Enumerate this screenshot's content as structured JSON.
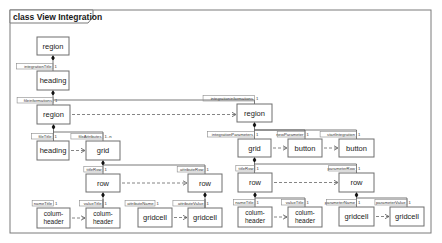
{
  "diagram": {
    "title": "class View Integration",
    "frame": {
      "x": 10,
      "y": 10,
      "w": 421,
      "h": 223
    },
    "classes": [
      {
        "id": "c1",
        "label": "region",
        "x": 37,
        "y": 37,
        "w": 32,
        "h": 18
      },
      {
        "id": "c2",
        "label": "heading",
        "x": 37,
        "y": 71,
        "w": 32,
        "h": 19
      },
      {
        "id": "c3",
        "label": "region",
        "x": 37,
        "y": 105,
        "w": 33,
        "h": 19
      },
      {
        "id": "c4",
        "label": "heading",
        "x": 37,
        "y": 141,
        "w": 32,
        "h": 19
      },
      {
        "id": "c5",
        "label": "grid",
        "x": 86,
        "y": 141,
        "w": 34,
        "h": 19
      },
      {
        "id": "c6",
        "label": "row",
        "x": 86,
        "y": 174,
        "w": 34,
        "h": 18
      },
      {
        "id": "c7",
        "label": "row",
        "x": 188,
        "y": 174,
        "w": 34,
        "h": 18
      },
      {
        "id": "c8",
        "label": "colum-|header",
        "x": 37,
        "y": 208,
        "w": 33,
        "h": 20
      },
      {
        "id": "c9",
        "label": "colum-|header",
        "x": 86,
        "y": 208,
        "w": 34,
        "h": 20
      },
      {
        "id": "c10",
        "label": "gridcell",
        "x": 138,
        "y": 208,
        "w": 34,
        "h": 19
      },
      {
        "id": "c11",
        "label": "gridcell",
        "x": 188,
        "y": 208,
        "w": 34,
        "h": 19
      },
      {
        "id": "c12",
        "label": "region",
        "x": 237,
        "y": 104,
        "w": 35,
        "h": 18
      },
      {
        "id": "c13",
        "label": "grid",
        "x": 238,
        "y": 139,
        "w": 33,
        "h": 18
      },
      {
        "id": "c14",
        "label": "button",
        "x": 288,
        "y": 139,
        "w": 34,
        "h": 18
      },
      {
        "id": "c15",
        "label": "button",
        "x": 339,
        "y": 139,
        "w": 35,
        "h": 18
      },
      {
        "id": "c16",
        "label": "row",
        "x": 238,
        "y": 173,
        "w": 34,
        "h": 19
      },
      {
        "id": "c17",
        "label": "row",
        "x": 339,
        "y": 173,
        "w": 35,
        "h": 19
      },
      {
        "id": "c18",
        "label": "colum-|header",
        "x": 238,
        "y": 207,
        "w": 34,
        "h": 20
      },
      {
        "id": "c19",
        "label": "colum-|header",
        "x": 288,
        "y": 207,
        "w": 34,
        "h": 20
      },
      {
        "id": "c20",
        "label": "gridcell",
        "x": 339,
        "y": 207,
        "w": 35,
        "h": 19
      },
      {
        "id": "c21",
        "label": "gridcell",
        "x": 390,
        "y": 207,
        "w": 34,
        "h": 19
      }
    ],
    "compositions": [
      {
        "from": "c1",
        "role": "integrationTitle",
        "mult": "1",
        "to": "c2"
      },
      {
        "from": "c2",
        "role": "fileinformations",
        "mult": "1",
        "to": "c3"
      },
      {
        "from": "c2",
        "role": "integrationinformations",
        "mult": "1",
        "to": "c12"
      },
      {
        "from": "c3",
        "role": "fileTitle",
        "mult": "1",
        "to": "c4"
      },
      {
        "from": "c3",
        "role": "fileAttributes",
        "mult": "1..n",
        "to": "c5"
      },
      {
        "from": "c5",
        "role": "titleRow",
        "mult": "1",
        "to": "c6"
      },
      {
        "from": "c5",
        "role": "attributeRow",
        "mult": "1",
        "to": "c7"
      },
      {
        "from": "c6",
        "role": "nameTitle",
        "mult": "1",
        "to": "c8"
      },
      {
        "from": "c6",
        "role": "valueTitle",
        "mult": "1",
        "to": "c9"
      },
      {
        "from": "c7",
        "role": "attributeName",
        "mult": "1",
        "to": "c10"
      },
      {
        "from": "c7",
        "role": "attributeValue",
        "mult": "1",
        "to": "c11"
      },
      {
        "from": "c12",
        "role": "integrationParameters",
        "mult": "1",
        "to": "c13"
      },
      {
        "from": "c12",
        "role": "newParameter",
        "mult": "1",
        "to": "c14"
      },
      {
        "from": "c12",
        "role": "startIntegration",
        "mult": "1",
        "to": "c15"
      },
      {
        "from": "c13",
        "role": "titleRow",
        "mult": "1",
        "to": "c16"
      },
      {
        "from": "c13",
        "role": "parameterRow",
        "mult": "1",
        "to": "c17"
      },
      {
        "from": "c16",
        "role": "nameTitle",
        "mult": "1",
        "to": "c18"
      },
      {
        "from": "c16",
        "role": "valueTitle",
        "mult": "1",
        "to": "c19"
      },
      {
        "from": "c17",
        "role": "parameterName",
        "mult": "1",
        "to": "c20"
      },
      {
        "from": "c17",
        "role": "parameterValue",
        "mult": "1",
        "to": "c21"
      }
    ],
    "dependencies": [
      {
        "from": "c3",
        "to": "c12"
      },
      {
        "from": "c4",
        "to": "c5"
      },
      {
        "from": "c6",
        "to": "c7"
      },
      {
        "from": "c8",
        "to": "c9"
      },
      {
        "from": "c10",
        "to": "c11"
      },
      {
        "from": "c13",
        "to": "c14"
      },
      {
        "from": "c14",
        "to": "c15"
      },
      {
        "from": "c16",
        "to": "c17"
      },
      {
        "from": "c18",
        "to": "c19"
      },
      {
        "from": "c20",
        "to": "c21"
      }
    ]
  }
}
